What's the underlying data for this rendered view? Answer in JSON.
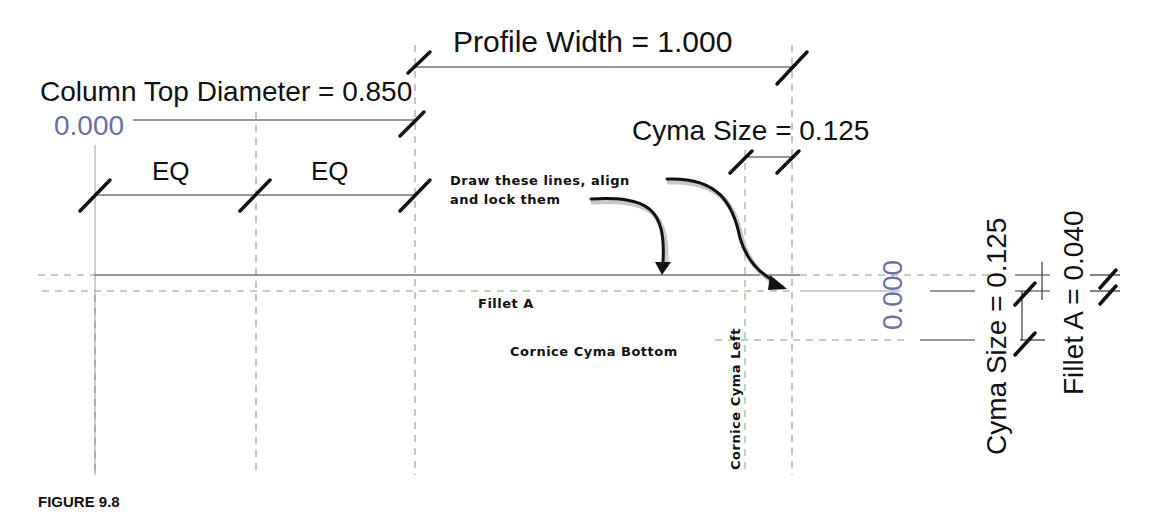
{
  "figure": {
    "caption": "FIGURE 9.8",
    "dimensions": {
      "profile_width": "Profile Width = 1.000",
      "column_top_diameter": "Column Top Diameter = 0.850",
      "origin_x": "0.000",
      "eq_left": "EQ",
      "eq_right": "EQ",
      "cyma_size_horizontal": "Cyma Size = 0.125",
      "origin_y": "0.000",
      "cyma_size_vertical": "Cyma Size = 0.125",
      "fillet_a": "Fillet A = 0.040"
    },
    "annotation": {
      "line1": "Draw these lines, align",
      "line2": "and lock them"
    },
    "reference_planes": {
      "fillet_a": "Fillet A",
      "cornice_cyma_bottom": "Cornice Cyma Bottom",
      "cornice_cyma_left": "Cornice Cyma Left"
    },
    "colors": {
      "reference_plane": "#7fa877",
      "temp_dimension": "#6a6fa6",
      "ink": "#111111"
    }
  }
}
